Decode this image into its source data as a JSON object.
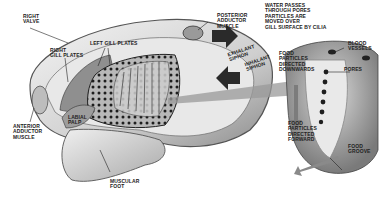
{
  "diagram": {
    "labels": {
      "right_valve": "RIGHT\nVALVE",
      "right_gill_plates": "RIGHT\nGILL PLATES",
      "left_gill_plates": "LEFT GILL PLATES",
      "posterior_adductor": "POSTERIOR\nADDUCTOR\nMUSCLE",
      "exhalant_siphon": "EXHALANT\nSIPHON",
      "inhalant_siphon": "INHALANT\nSIPHON",
      "water_passes": "WATER PASSES\nTHROUGH PORES\nPARTICLES ARE\nMOVED OVER\nGILL SURFACE BY CILIA",
      "blood_vessels": "BLOOD\nVESSELS",
      "pores": "PORES",
      "food_downwards": "FOOD\nPARTICLES\nDIRECTED\nDOWNWARDS",
      "food_forward": "FOOD\nPARTICLES\nDIRECTED\nFORWARD",
      "food_groove": "FOOD\nGROOVE",
      "anterior_adductor": "ANTERIOR\nADDUCTOR\nMUSCLE",
      "labial_palp": "LABIAL\nPALP",
      "muscular_foot": "MUSCULAR\nFOOT"
    },
    "colors": {
      "shell": "#e6e6e6",
      "shell_edge": "#6a6a6a",
      "gill": "#9a9a9a",
      "pore": "#1e1e1e",
      "arrow": "#2a2a2a",
      "foot": "#d8d8d8"
    }
  }
}
